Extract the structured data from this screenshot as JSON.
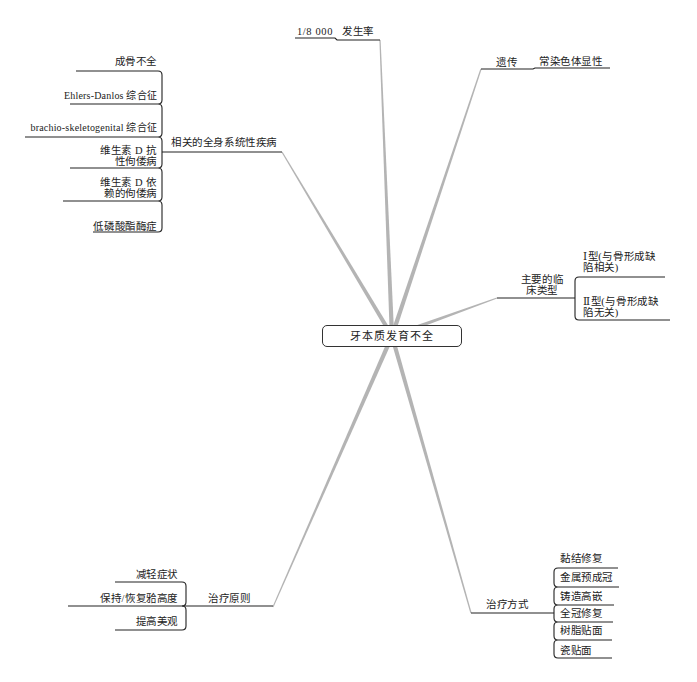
{
  "central_topic": "牙本质发育不全",
  "branches": {
    "incidence": {
      "value": "1/8 000",
      "label": "发生率"
    },
    "heredity": {
      "label": "遗传",
      "value": "常染色体显性"
    },
    "clinical_types": {
      "label_lines": [
        "主要的临",
        "床类型"
      ],
      "items": [
        {
          "lines": [
            "Ⅰ型(与骨形成缺",
            "陷相关)"
          ]
        },
        {
          "lines": [
            "Ⅱ型(与骨形成缺",
            "陷无关)"
          ]
        }
      ]
    },
    "related_diseases": {
      "label": "相关的全身系统性疾病",
      "items": [
        {
          "lines": [
            "成骨不全"
          ]
        },
        {
          "lines": [
            "Ehlers-Danlos 综合征"
          ]
        },
        {
          "lines": [
            "brachio-skeletogenital 综合征"
          ]
        },
        {
          "lines": [
            "维生素 D 抗",
            "性佝偻病"
          ]
        },
        {
          "lines": [
            "维生素 D 依",
            "赖的佝偻病"
          ]
        },
        {
          "lines": [
            "低磷酸酯酶症"
          ]
        }
      ]
    },
    "treatment_principles": {
      "label": "治疗原则",
      "items": [
        "减轻症状",
        "保持/恢复𬌗高度",
        "提高美观"
      ]
    },
    "treatment_methods": {
      "label": "治疗方式",
      "items": [
        "黏结修复",
        "金属预成冠",
        "铸造高嵌",
        "全冠修复",
        "树脂贴面",
        "瓷贴面"
      ]
    }
  },
  "colors": {
    "branch_line": "#b4b4b4",
    "connector_line": "#222222",
    "text": "#222222",
    "node_border": "#333333",
    "background": "#ffffff"
  }
}
